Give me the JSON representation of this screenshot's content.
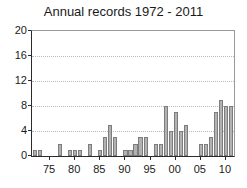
{
  "chart_data": {
    "type": "bar",
    "title": "Annual records 1972 - 2011",
    "xlabel": "",
    "ylabel": "",
    "ylim": [
      0,
      20
    ],
    "yticks": [
      0,
      4,
      8,
      12,
      16,
      20
    ],
    "xticks": [
      1975,
      1980,
      1985,
      1990,
      1995,
      2000,
      2005,
      2010
    ],
    "xtick_labels": [
      "75",
      "80",
      "85",
      "90",
      "95",
      "00",
      "05",
      "10"
    ],
    "xlim": [
      1971.4,
      2011.6
    ],
    "grid": "horizontal-dotted",
    "legend": "none",
    "bar_color": "#b2b2b2",
    "bar_edge_color": "#7d7d7d",
    "axis_color": "#2b2b2b",
    "grid_color": "#b9b9b9",
    "categories": [
      1972,
      1973,
      1974,
      1975,
      1976,
      1977,
      1978,
      1979,
      1980,
      1981,
      1982,
      1983,
      1984,
      1985,
      1986,
      1987,
      1988,
      1989,
      1990,
      1991,
      1992,
      1993,
      1994,
      1995,
      1996,
      1997,
      1998,
      1999,
      2000,
      2001,
      2002,
      2003,
      2004,
      2005,
      2006,
      2007,
      2008,
      2009,
      2010,
      2011
    ],
    "values": [
      1,
      1,
      0,
      0,
      0,
      2,
      0,
      1,
      1,
      1,
      0,
      2,
      0,
      1,
      3,
      5,
      3,
      0,
      1,
      1,
      2,
      3,
      3,
      0,
      2,
      2,
      8,
      4,
      7,
      4,
      5,
      0,
      0,
      2,
      2,
      3,
      7,
      9,
      8,
      8
    ],
    "values_by_year": [
      {
        "year": 1972,
        "value": 1
      },
      {
        "year": 1973,
        "value": 1
      },
      {
        "year": 1974,
        "value": 0
      },
      {
        "year": 1975,
        "value": 0
      },
      {
        "year": 1976,
        "value": 0
      },
      {
        "year": 1977,
        "value": 2
      },
      {
        "year": 1978,
        "value": 0
      },
      {
        "year": 1979,
        "value": 1
      },
      {
        "year": 1980,
        "value": 1
      },
      {
        "year": 1981,
        "value": 1
      },
      {
        "year": 1982,
        "value": 0
      },
      {
        "year": 1983,
        "value": 2
      },
      {
        "year": 1984,
        "value": 0
      },
      {
        "year": 1985,
        "value": 1
      },
      {
        "year": 1986,
        "value": 3
      },
      {
        "year": 1987,
        "value": 5
      },
      {
        "year": 1988,
        "value": 3
      },
      {
        "year": 1989,
        "value": 0
      },
      {
        "year": 1990,
        "value": 1
      },
      {
        "year": 1991,
        "value": 1
      },
      {
        "year": 1992,
        "value": 2
      },
      {
        "year": 1993,
        "value": 3
      },
      {
        "year": 1994,
        "value": 3
      },
      {
        "year": 1995,
        "value": 0
      },
      {
        "year": 1996,
        "value": 2
      },
      {
        "year": 1997,
        "value": 2
      },
      {
        "year": 1998,
        "value": 8
      },
      {
        "year": 1999,
        "value": 4
      },
      {
        "year": 2000,
        "value": 7
      },
      {
        "year": 2001,
        "value": 4
      },
      {
        "year": 2002,
        "value": 5
      },
      {
        "year": 2003,
        "value": 0
      },
      {
        "year": 2004,
        "value": 0
      },
      {
        "year": 2005,
        "value": 2
      },
      {
        "year": 2006,
        "value": 2
      },
      {
        "year": 2007,
        "value": 3
      },
      {
        "year": 2008,
        "value": 7
      },
      {
        "year": 2009,
        "value": 9
      },
      {
        "year": 2010,
        "value": 8
      },
      {
        "year": 2011,
        "value": 8
      }
    ]
  }
}
